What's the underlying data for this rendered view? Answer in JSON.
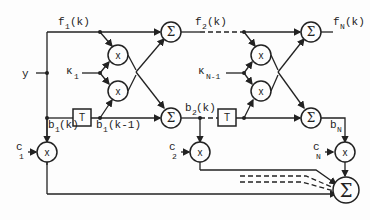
{
  "diagram": {
    "type": "lattice-filter-block-diagram",
    "labels": {
      "input": "y",
      "f1": "f",
      "f1_sub": "1",
      "f1_arg": "(k)",
      "f2": "f",
      "f2_sub": "2",
      "f2_arg": "(k)",
      "fN": "f",
      "fN_sub": "N",
      "fN_arg": "(k)",
      "kappa1": "κ",
      "kappa1_sub": "1",
      "kappaN1": "κ",
      "kappaN1_sub": "N-1",
      "b1k": "b",
      "b1k_sub": "1",
      "b1k_arg": "(k)",
      "b1k1": "b",
      "b1k1_sub": "1",
      "b1k1_arg": "(k-1)",
      "b2k": "b",
      "b2k_sub": "2",
      "b2k_arg": "(k)",
      "bN": "b",
      "bN_sub": "N",
      "c1": "c",
      "c1_sub": "1",
      "c2": "c",
      "c2_sub": "2",
      "cN": "c",
      "cN_sub": "N"
    },
    "symbols": {
      "sum": "Σ",
      "multiply": "x",
      "delay": "T"
    },
    "colors": {
      "line": "#222222",
      "background": "#fdfdfd"
    }
  }
}
